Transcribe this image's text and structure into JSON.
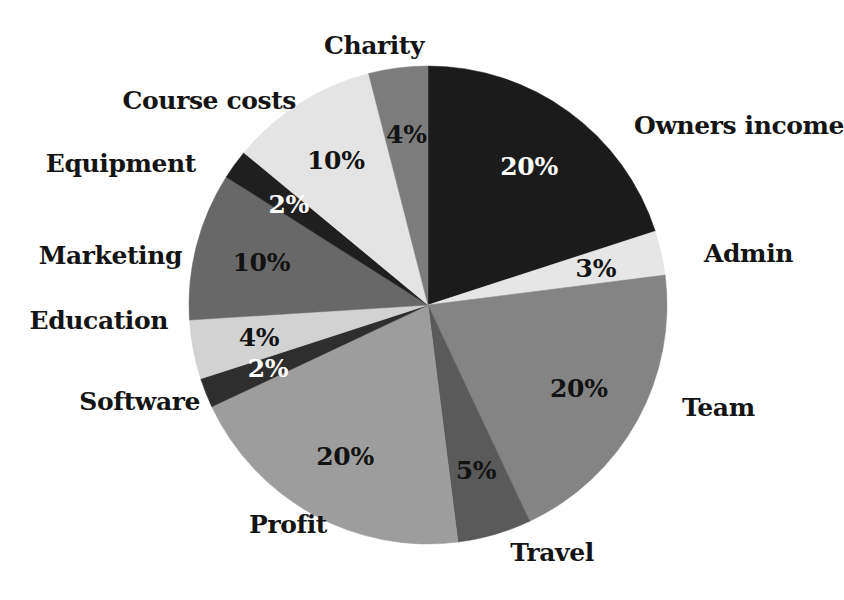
{
  "chart_data": {
    "type": "pie",
    "title": "",
    "subtitle": "",
    "xlabel": "",
    "ylabel": "",
    "legend_position": "none",
    "grid": false,
    "value_suffix": "%",
    "total": 100,
    "start_angle_deg": 0,
    "direction": "clockwise",
    "categories": [
      "Owners income",
      "Admin",
      "Team",
      "Travel",
      "Profit",
      "Software",
      "Education",
      "Marketing",
      "Equipment",
      "Course costs",
      "Charity"
    ],
    "values": [
      20,
      3,
      20,
      5,
      20,
      2,
      4,
      10,
      2,
      10,
      4
    ],
    "slices": [
      {
        "label": "Owners income",
        "value": 20,
        "value_text": "20%",
        "color": "#1b1b1b",
        "value_text_color": "#ffffff",
        "label_anchor": "left"
      },
      {
        "label": "Admin",
        "value": 3,
        "value_text": "3%",
        "color": "#e6e6e6",
        "value_text_color": "#121212",
        "label_anchor": "left"
      },
      {
        "label": "Team",
        "value": 20,
        "value_text": "20%",
        "color": "#848484",
        "value_text_color": "#121212",
        "label_anchor": "left"
      },
      {
        "label": "Travel",
        "value": 5,
        "value_text": "5%",
        "color": "#5a5a5a",
        "value_text_color": "#121212",
        "label_anchor": "center"
      },
      {
        "label": "Profit",
        "value": 20,
        "value_text": "20%",
        "color": "#9d9d9d",
        "value_text_color": "#121212",
        "label_anchor": "center"
      },
      {
        "label": "Software",
        "value": 2,
        "value_text": "2%",
        "color": "#2e2e2e",
        "value_text_color": "#ffffff",
        "label_anchor": "right"
      },
      {
        "label": "Education",
        "value": 4,
        "value_text": "4%",
        "color": "#d2d2d2",
        "value_text_color": "#121212",
        "label_anchor": "right"
      },
      {
        "label": "Marketing",
        "value": 10,
        "value_text": "10%",
        "color": "#686868",
        "value_text_color": "#121212",
        "label_anchor": "right"
      },
      {
        "label": "Equipment",
        "value": 2,
        "value_text": "2%",
        "color": "#1f1f1f",
        "value_text_color": "#ffffff",
        "label_anchor": "right"
      },
      {
        "label": "Course costs",
        "value": 10,
        "value_text": "10%",
        "color": "#e4e4e4",
        "value_text_color": "#121212",
        "label_anchor": "right"
      },
      {
        "label": "Charity",
        "value": 4,
        "value_text": "4%",
        "color": "#7c7c7c",
        "value_text_color": "#121212",
        "label_anchor": "center"
      }
    ],
    "geometry": {
      "center_x": 428,
      "center_y": 305,
      "radius": 239,
      "value_label_radius_factor": 0.72,
      "name_label_radius_offset": 26
    },
    "label_positions": {
      "Owners income": {
        "x": 634,
        "y": 125,
        "anchor": "left"
      },
      "Admin": {
        "x": 704,
        "y": 253,
        "anchor": "left"
      },
      "Team": {
        "x": 682,
        "y": 407,
        "anchor": "left"
      },
      "Travel": {
        "x": 552,
        "y": 552,
        "anchor": "center"
      },
      "Profit": {
        "x": 288,
        "y": 524,
        "anchor": "center"
      },
      "Software": {
        "x": 200,
        "y": 401,
        "anchor": "right"
      },
      "Education": {
        "x": 168,
        "y": 320,
        "anchor": "right"
      },
      "Marketing": {
        "x": 182,
        "y": 255,
        "anchor": "right"
      },
      "Equipment": {
        "x": 196,
        "y": 163,
        "anchor": "right"
      },
      "Course costs": {
        "x": 296,
        "y": 100,
        "anchor": "right"
      },
      "Charity": {
        "x": 374,
        "y": 45,
        "anchor": "center"
      }
    },
    "background_color": "#ffffff"
  }
}
